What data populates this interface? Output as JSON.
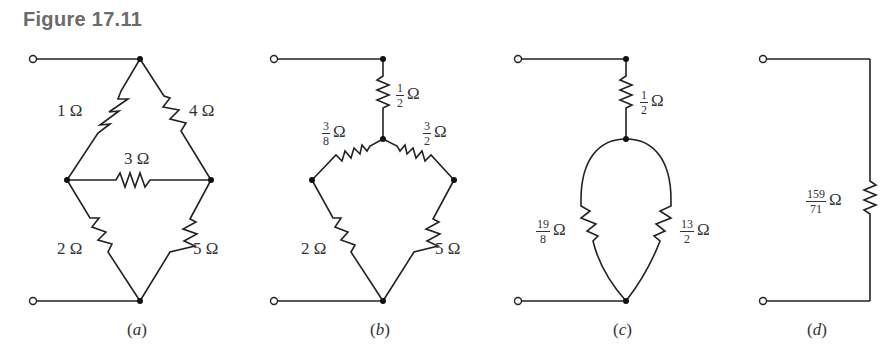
{
  "figure": {
    "title": "Figure 17.11",
    "unit": "Ω"
  },
  "panels": [
    {
      "id": "a",
      "caption_open": "(",
      "caption_letter": "a",
      "caption_close": ")",
      "resistors": [
        {
          "name": "R1",
          "value": "1 Ω"
        },
        {
          "name": "R4",
          "value": "4 Ω"
        },
        {
          "name": "R3",
          "value": "3 Ω"
        },
        {
          "name": "R2",
          "value": "2 Ω"
        },
        {
          "name": "R5",
          "value": "5 Ω"
        }
      ]
    },
    {
      "id": "b",
      "caption_open": "(",
      "caption_letter": "b",
      "caption_close": ")",
      "resistors": [
        {
          "name": "Rtop",
          "num": "1",
          "den": "2",
          "unit": "Ω"
        },
        {
          "name": "Rleft",
          "num": "3",
          "den": "8",
          "unit": "Ω"
        },
        {
          "name": "Rright",
          "num": "3",
          "den": "2",
          "unit": "Ω"
        },
        {
          "name": "R2",
          "value": "2 Ω"
        },
        {
          "name": "R5",
          "value": "5 Ω"
        }
      ]
    },
    {
      "id": "c",
      "caption_open": "(",
      "caption_letter": "c",
      "caption_close": ")",
      "resistors": [
        {
          "name": "Rtop",
          "num": "1",
          "den": "2",
          "unit": "Ω"
        },
        {
          "name": "Rleft",
          "num": "19",
          "den": "8",
          "unit": "Ω"
        },
        {
          "name": "Rright",
          "num": "13",
          "den": "2",
          "unit": "Ω"
        }
      ]
    },
    {
      "id": "d",
      "caption_open": "(",
      "caption_letter": "d",
      "caption_close": ")",
      "resistors": [
        {
          "name": "Req",
          "num": "159",
          "den": "71",
          "unit": "Ω"
        }
      ]
    }
  ]
}
